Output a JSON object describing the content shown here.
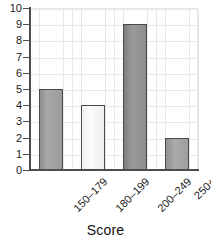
{
  "chart_data": {
    "type": "bar",
    "title": "",
    "subtitle": "",
    "xlabel": "Score",
    "ylabel": "",
    "categories": [
      "150–179",
      "180–199",
      "200–249",
      "250+"
    ],
    "values": [
      5,
      4,
      9,
      2
    ],
    "series": [
      {
        "name": "Count",
        "values": [
          5,
          4,
          9,
          2
        ]
      }
    ],
    "ylim": [
      0,
      10
    ],
    "xlim": [
      0,
      4
    ],
    "y_ticks": [
      0,
      1,
      2,
      3,
      4,
      5,
      6,
      7,
      8,
      9,
      10
    ],
    "y_tick_labels": [
      "0",
      "1",
      "2",
      "3",
      "4",
      "5",
      "6",
      "7",
      "8",
      "9",
      "10"
    ],
    "grid": true,
    "grid_axis": "both",
    "legend": false,
    "legend_position": "none",
    "x_tick_label_rotation": 45,
    "bar_colors": [
      "#9e9e9e",
      "#f4f4f4",
      "#8d8d8d",
      "#a0a0a0"
    ],
    "bar_edge_color": "#4a4a4a",
    "grid_color": "#e8e8e8",
    "axis_color": "#4d4d4d",
    "background_color": "#ffffff",
    "text_color": "#1a1a1a"
  },
  "axis": {
    "x_title": "Score",
    "y_labels": [
      "10",
      "9",
      "8",
      "7",
      "6",
      "5",
      "4",
      "3",
      "2",
      "1",
      "0"
    ],
    "x_labels": [
      "150–179",
      "180–199",
      "200–249",
      "250+"
    ]
  }
}
